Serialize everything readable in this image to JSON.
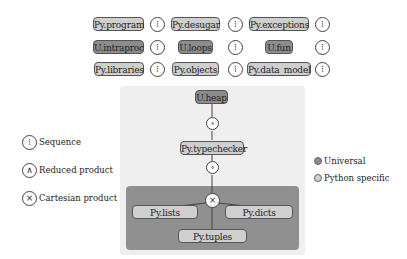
{
  "grid": {
    "rows": [
      [
        {
          "label": "Py.program",
          "kind": "python",
          "op": "sequence"
        },
        {
          "label": "Py.desugar",
          "kind": "python",
          "op": "sequence"
        },
        {
          "label": "Py.exceptions",
          "kind": "python",
          "op": "sequence"
        }
      ],
      [
        {
          "label": "U.intraproc",
          "kind": "universal",
          "op": "sequence"
        },
        {
          "label": "U.loops",
          "kind": "universal",
          "op": "sequence"
        },
        {
          "label": "U.fun",
          "kind": "universal",
          "op": "sequence"
        }
      ],
      [
        {
          "label": "Py.libraries",
          "kind": "python",
          "op": "sequence"
        },
        {
          "label": "Py.objects",
          "kind": "python",
          "op": "sequence"
        },
        {
          "label": "Py.data_model",
          "kind": "python",
          "op": "sequence"
        }
      ]
    ],
    "sequence_glyph": "⁝"
  },
  "stack": {
    "heap": {
      "label": "U.heap",
      "kind": "universal"
    },
    "op1": {
      "glyph": "∘",
      "name": "composition"
    },
    "typechecker": {
      "label": "Py.typechecker",
      "kind": "python"
    },
    "op2": {
      "glyph": "∘",
      "name": "composition"
    },
    "product": {
      "glyph": "×",
      "name": "cartesian-product"
    },
    "lists": {
      "label": "Py.lists",
      "kind": "python"
    },
    "dicts": {
      "label": "Py.dicts",
      "kind": "python"
    },
    "tuples": {
      "label": "Py.tuples",
      "kind": "python"
    }
  },
  "legend_ops": [
    {
      "glyph": "⁝",
      "label": "Sequence"
    },
    {
      "glyph": "∧",
      "label": "Reduced product"
    },
    {
      "glyph": "×",
      "label": "Cartesian product"
    }
  ],
  "legend_kinds": [
    {
      "label": "Universal",
      "color": "#8c8c8c"
    },
    {
      "label": "Python specific",
      "color": "#cfcfcf"
    }
  ],
  "colors": {
    "universal": "#8c8c8c",
    "python": "#cfcfcf",
    "panel_outer": "#efefef",
    "panel_inner": "#909090"
  }
}
